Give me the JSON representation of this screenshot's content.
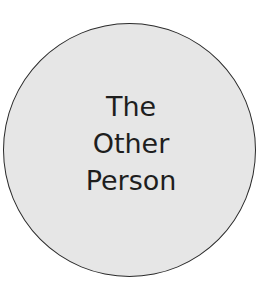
{
  "diagram": {
    "shape": "circle",
    "fill_color": "#e6e6e6",
    "stroke_color": "#2a2a2a",
    "label_lines": [
      "The",
      "Other",
      "Person"
    ]
  }
}
